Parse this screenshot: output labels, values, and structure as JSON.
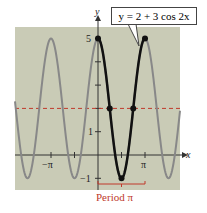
{
  "chart_data": {
    "type": "line",
    "title": "",
    "equation": "y = 2 + 3 cos 2x",
    "xlabel": "x",
    "ylabel": "y",
    "x_ticks": [
      "-π",
      "π"
    ],
    "y_ticks": [
      "-1",
      "1",
      "5"
    ],
    "xlim": [
      -5.2,
      5.3
    ],
    "ylim": [
      -1.5,
      5.5
    ],
    "midline": 2,
    "series": [
      {
        "name": "y = 2 + 3 cos 2x",
        "formula": "2+3*cos(2x)",
        "style": "gray"
      },
      {
        "name": "one period [0, π]",
        "formula": "2+3*cos(2x)",
        "domain": [
          0,
          3.1416
        ],
        "style": "black-bold"
      }
    ],
    "points": [
      {
        "x": 0,
        "y": 5
      },
      {
        "x": 0.785,
        "y": 2
      },
      {
        "x": 1.571,
        "y": -1
      },
      {
        "x": 2.356,
        "y": 2
      },
      {
        "x": 3.1416,
        "y": 5
      }
    ],
    "annotation": "Period π",
    "colors": {
      "background": "#c9cbb6",
      "curve": "#888888",
      "bold": "#111111",
      "midline": "#c0392b",
      "annotation": "#c0392b"
    }
  },
  "labels": {
    "x_axis": "x",
    "y_axis": "y",
    "neg_pi": "−π",
    "pi": "π",
    "y5": "5",
    "y1": "1",
    "yneg1": "−1",
    "equation": "y = 2 + 3 cos 2x",
    "period": "Period π"
  }
}
